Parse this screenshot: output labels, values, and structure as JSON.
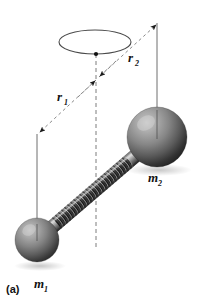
{
  "figure": {
    "panel_label": "(a)",
    "background_color": "#ffffff",
    "stroke_color": "#444444",
    "dash_color": "#777777",
    "ink_color": "#111111",
    "width": 201,
    "height": 301,
    "labels": {
      "r1": {
        "base": "r",
        "sub": "1",
        "x": 57,
        "y": 100
      },
      "r2": {
        "base": "r",
        "sub": "2",
        "x": 128,
        "y": 62
      },
      "m1": {
        "base": "m",
        "sub": "1",
        "x": 38,
        "y": 288
      },
      "m2": {
        "base": "m",
        "sub": "2",
        "x": 152,
        "y": 182
      }
    },
    "orbit_ellipse": {
      "cx": 95,
      "cy": 42,
      "rx": 36,
      "ry": 12,
      "stroke": "#444444"
    },
    "center_of_mass_dot": {
      "cx": 96,
      "cy": 54,
      "r": 2,
      "fill": "#111111"
    },
    "rotation_axis": {
      "x": 96,
      "y_top": 54,
      "y_bottom": 248,
      "dash": "4,3",
      "stroke": "#777777"
    },
    "mass_1": {
      "cx": 37,
      "cy": 240,
      "r": 22,
      "highlight_color": "#b4b4b4",
      "mid_color": "#737373",
      "shadow_color": "#2b2b2b"
    },
    "mass_2": {
      "cx": 157,
      "cy": 137,
      "r": 30,
      "highlight_color": "#b9b9b9",
      "mid_color": "#787878",
      "shadow_color": "#262626"
    },
    "rod": {
      "x1": 37,
      "y1": 240,
      "x2": 157,
      "y2": 137,
      "half_width": 7,
      "coil_count": 34,
      "light_color": "#cfcfcf",
      "dark_color": "#3a3a3a"
    },
    "axis_line_m1": {
      "x": 37,
      "y_top": 134,
      "y_bottom": 244,
      "stroke": "#6b6b6b"
    },
    "axis_line_m2": {
      "x": 157,
      "y_top": 23,
      "y_bottom": 142,
      "stroke": "#6b6b6b"
    },
    "arrow_r1": {
      "x1": 96,
      "y1": 81,
      "x2": 38,
      "y2": 134,
      "dash": "3,3",
      "stroke": "#808080"
    },
    "arrow_r2": {
      "x1": 98,
      "y1": 77,
      "x2": 157,
      "y2": 24,
      "dash": "3,3",
      "stroke": "#808080"
    }
  }
}
